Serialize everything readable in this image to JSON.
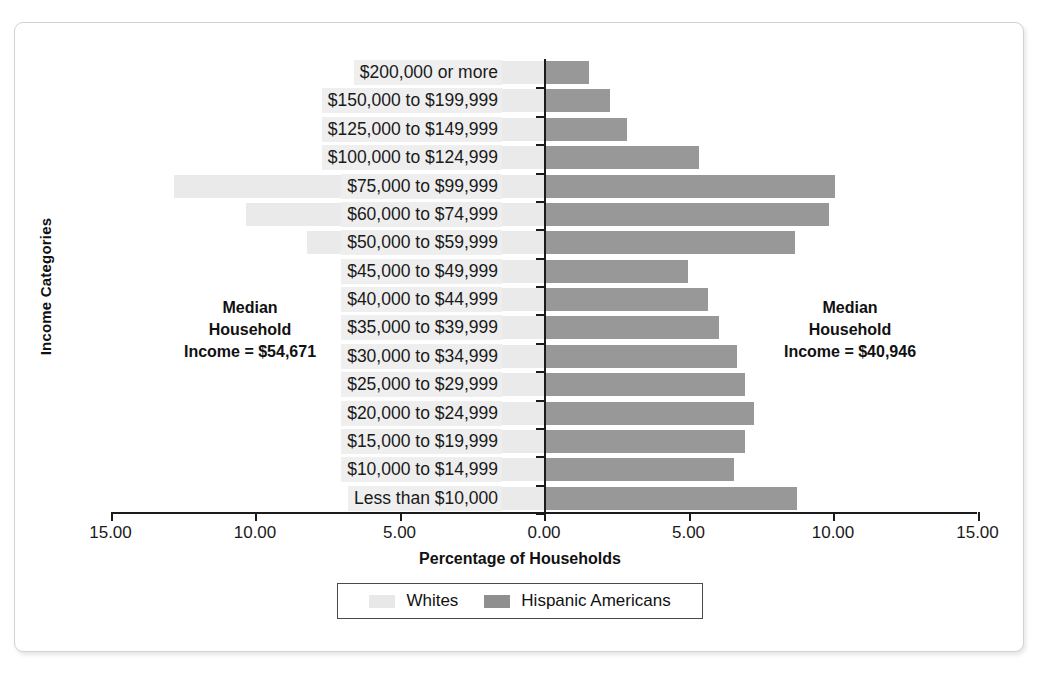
{
  "chart_data": {
    "type": "bar",
    "subtype": "diverging-population-pyramid",
    "title": "",
    "xlabel": "Percentage of Households",
    "ylabel": "Income Categories",
    "xticks": [
      "15.00",
      "10.00",
      "5.00",
      "0.00",
      "5.00",
      "10.00",
      "15.00"
    ],
    "xtick_values": [
      -15,
      -10,
      -5,
      0,
      5,
      10,
      15
    ],
    "xlim": [
      -15,
      15
    ],
    "grid": false,
    "legend_position": "bottom",
    "categories": [
      "$200,000 or more",
      "$150,000 to $199,999",
      "$125,000 to $149,999",
      "$100,000 to $124,999",
      "$75,000 to $99,999",
      "$60,000 to $74,999",
      "$50,000 to $59,999",
      "$45,000 to $49,999",
      "$40,000 to $44,999",
      "$35,000 to $39,999",
      "$30,000 to $34,999",
      "$25,000 to $29,999",
      "$20,000 to $24,999",
      "$15,000 to $19,999",
      "$10,000 to $14,999",
      "Less than $10,000"
    ],
    "series": [
      {
        "name": "Whites",
        "color": "#eaeaea",
        "side": "left",
        "values": [
          1.7,
          2.6,
          3.0,
          5.0,
          12.8,
          10.3,
          8.2,
          5.0,
          5.0,
          5.0,
          5.0,
          5.0,
          5.0,
          5.0,
          5.0,
          5.0
        ]
      },
      {
        "name": "Hispanic Americans",
        "color": "#989898",
        "side": "right",
        "values": [
          1.5,
          2.2,
          2.8,
          5.3,
          10.0,
          9.8,
          8.6,
          4.9,
          5.6,
          6.0,
          6.6,
          6.9,
          7.2,
          6.9,
          6.5,
          8.7
        ]
      }
    ],
    "annotations": [
      {
        "id": "whites-median",
        "lines": [
          "Median",
          "Household",
          "Income = $54,671"
        ]
      },
      {
        "id": "hispanic-median",
        "lines": [
          "Median",
          "Household",
          "Income = $40,946"
        ]
      }
    ]
  },
  "axes": {
    "x_label": "Percentage of Households",
    "y_label": "Income Categories",
    "x_ticks": [
      "15.00",
      "10.00",
      "5.00",
      "0.00",
      "5.00",
      "10.00",
      "15.00"
    ]
  },
  "annotations": {
    "left": {
      "line1": "Median",
      "line2": "Household",
      "line3": "Income = $54,671"
    },
    "right": {
      "line1": "Median",
      "line2": "Household",
      "line3": "Income = $40,946"
    }
  },
  "legend": {
    "items": [
      {
        "label": "Whites",
        "color": "#e8e8e8"
      },
      {
        "label": "Hispanic Americans",
        "color": "#8f8f8f"
      }
    ]
  }
}
